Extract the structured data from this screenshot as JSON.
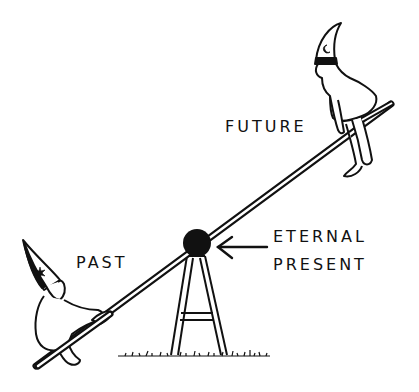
{
  "illustration": {
    "subject": "Two children on a seesaw balanced on a fulcrum",
    "labels": {
      "future": "FUTURE",
      "past": "PAST",
      "eternal": "ETERNAL",
      "present": "PRESENT"
    },
    "hat_symbols": {
      "future_child": "crescent-moon",
      "past_child": "star"
    },
    "colors": {
      "ink": "#111111",
      "background": "#ffffff"
    }
  }
}
